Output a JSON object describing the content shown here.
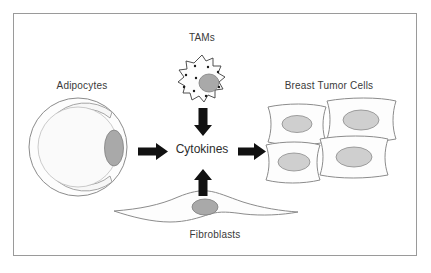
{
  "figure": {
    "frame_color": "#9a9a9a",
    "background": "#ffffff"
  },
  "labels": {
    "adipocytes": "Adipocytes",
    "tams": "TAMs",
    "breast_tumor_cells": "Breast Tumor Cells",
    "fibroblasts": "Fibroblasts",
    "cytokines": "Cytokines"
  },
  "colors": {
    "outline": "#8c8c8c",
    "nucleus_fill": "#a9a9a9",
    "nucleus_stroke": "#808080",
    "cell_fill": "#fdfdfd",
    "lipid_fill": "#f7f7f7",
    "arrow_fill": "#111111",
    "text": "#3a3a3a",
    "cytokines_text": "#2d2d2d",
    "granule_fill": "#1a1a1a"
  },
  "arrows": [
    {
      "name": "adipocytes-to-cytokines",
      "direction": "right",
      "from": "adipocytes",
      "to": "cytokines"
    },
    {
      "name": "tams-to-cytokines",
      "direction": "down",
      "from": "tams",
      "to": "cytokines"
    },
    {
      "name": "fibroblasts-to-cytokines",
      "direction": "up",
      "from": "fibroblasts",
      "to": "cytokines"
    },
    {
      "name": "cytokines-to-tumor-cells",
      "direction": "right",
      "from": "cytokines",
      "to": "breast_tumor_cells"
    }
  ],
  "cells": {
    "adipocyte": {
      "nucleus_count": 1,
      "lipid_droplet": true
    },
    "tam": {
      "nucleus_count": 1,
      "granule_count": 9,
      "membrane": "ruffled"
    },
    "fibroblast": {
      "nucleus_count": 1,
      "shape": "spindle"
    },
    "tumor_cells": {
      "count": 4,
      "nucleus_count": 4,
      "arrangement": "2x2-overlapping"
    }
  }
}
